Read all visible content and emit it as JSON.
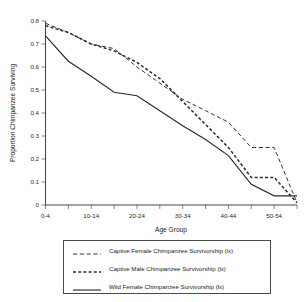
{
  "chart_data": {
    "type": "line",
    "title": "",
    "xlabel": "Age Group",
    "ylabel": "Proportion Chimpanzee Surviving",
    "categories": [
      "0-4",
      "5-9",
      "10-14",
      "15-19",
      "20-24",
      "25-29",
      "30-34",
      "35-39",
      "40-44",
      "45-49",
      "50-54",
      "55-59"
    ],
    "xtick_labels": [
      "0-4",
      "",
      "10-14",
      "",
      "20-24",
      "",
      "30-34",
      "",
      "40-44",
      "",
      "50-54",
      ""
    ],
    "ytick_labels": [
      "0",
      "0.1",
      "0.2",
      "0.3",
      "0.4",
      "0.5",
      "0.6",
      "0.7",
      "0.8"
    ],
    "ylim": [
      0,
      0.8
    ],
    "ytick_step": 0.1,
    "grid": false,
    "legend_position": "below-plot",
    "series": [
      {
        "name": "Captive Female Chimpanzee Survivorship (lx)",
        "style": "dashed-thin",
        "color": "#2a2a2a",
        "values": [
          0.79,
          0.75,
          0.7,
          0.68,
          0.6,
          0.53,
          0.46,
          0.41,
          0.36,
          0.25,
          0.25,
          0.01
        ]
      },
      {
        "name": "Captive Male Chimpanzee Survivorship (lx)",
        "style": "dashed-thick",
        "color": "#2a2a2a",
        "values": [
          0.78,
          0.75,
          0.7,
          0.67,
          0.62,
          0.55,
          0.45,
          0.35,
          0.25,
          0.12,
          0.12,
          0.01
        ]
      },
      {
        "name": "Wild Female Chimpanzee Survivorship (lx)",
        "style": "solid",
        "color": "#2a2a2a",
        "values": [
          0.735,
          0.625,
          0.56,
          0.49,
          0.475,
          0.41,
          0.345,
          0.285,
          0.215,
          0.09,
          0.04,
          0.04
        ]
      }
    ]
  },
  "legend": {
    "entries": [
      {
        "label": "Captive Female Chimpanzee Survivorship (lx)",
        "style": "dashed-thin"
      },
      {
        "label": "Captive Male Chimpanzee Survivorship (lx)",
        "style": "dashed-thick"
      },
      {
        "label": "Wild Female Chimpanzee Survivorship (lx)",
        "style": "solid"
      }
    ]
  }
}
